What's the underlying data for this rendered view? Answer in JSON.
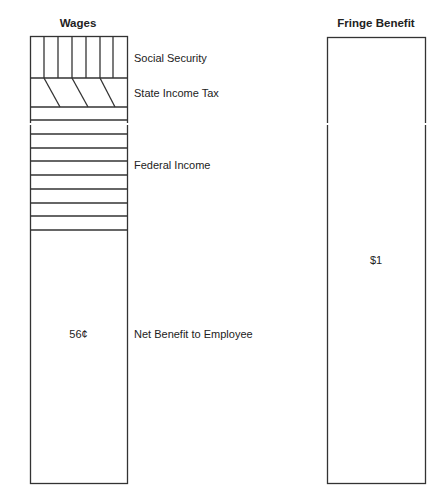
{
  "wages": {
    "title": "Wages",
    "segments": [
      {
        "name": "social-security",
        "label": "Social Security"
      },
      {
        "name": "state-income-tax",
        "label": "State Income Tax"
      },
      {
        "name": "federal-income",
        "label": "Federal Income"
      },
      {
        "name": "net-benefit",
        "label": "Net Benefit to Employee",
        "value": "56¢"
      }
    ]
  },
  "fringe": {
    "title": "Fringe Benefit",
    "value": "$1"
  },
  "colors": {
    "line": "#333333",
    "text": "#222222",
    "background": "#ffffff"
  }
}
